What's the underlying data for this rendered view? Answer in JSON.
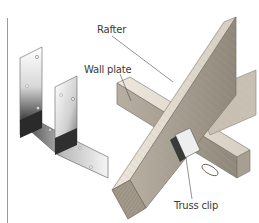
{
  "figure": {
    "type": "illustration",
    "labels": {
      "rafter": "Rafter",
      "wall_plate": "Wall plate",
      "truss_clip": "Truss clip"
    },
    "colors": {
      "background": "#ffffff",
      "metal_light": "#f2f2f2",
      "metal_dark": "#2b2b2b",
      "wood_light": "#e8e2d8",
      "wood_mid": "#c9c1b3",
      "wood_dark": "#8c8477",
      "leader_line": "#4a4a4a",
      "label_text": "#3a3a3a",
      "margin_rule": "#9a9a9a"
    }
  }
}
